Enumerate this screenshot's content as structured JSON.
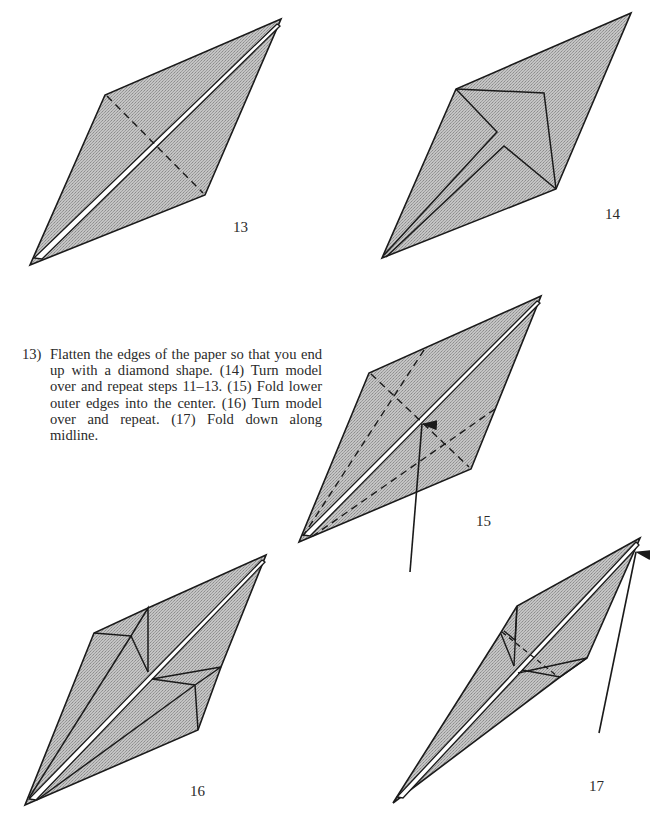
{
  "colors": {
    "fill": "#b9b9b9",
    "stroke": "#1a1a1a",
    "slit": "#ffffff",
    "text": "#2a2a2a"
  },
  "instructions": {
    "step_label": "13)",
    "text": "Flatten the edges of the paper so that you end up with a diamond shape. (14) Turn model over and repeat steps 11–13. (15) Fold lower outer edges into the center. (16) Turn model over and repeat. (17) Fold down along midline."
  },
  "figures": [
    {
      "id": "13",
      "label": "13",
      "label_pos": [
        233,
        236
      ]
    },
    {
      "id": "14",
      "label": "14",
      "label_pos": [
        605,
        225
      ]
    },
    {
      "id": "15",
      "label": "15",
      "label_pos": [
        476,
        530
      ]
    },
    {
      "id": "16",
      "label": "16",
      "label_pos": [
        190,
        800
      ]
    },
    {
      "id": "17",
      "label": "17",
      "label_pos": [
        589,
        795
      ]
    }
  ],
  "icons": {
    "fold_arrow": "arrow-up-icon",
    "valley_fold_line": "dashed-line",
    "crease_line": "solid-line"
  }
}
